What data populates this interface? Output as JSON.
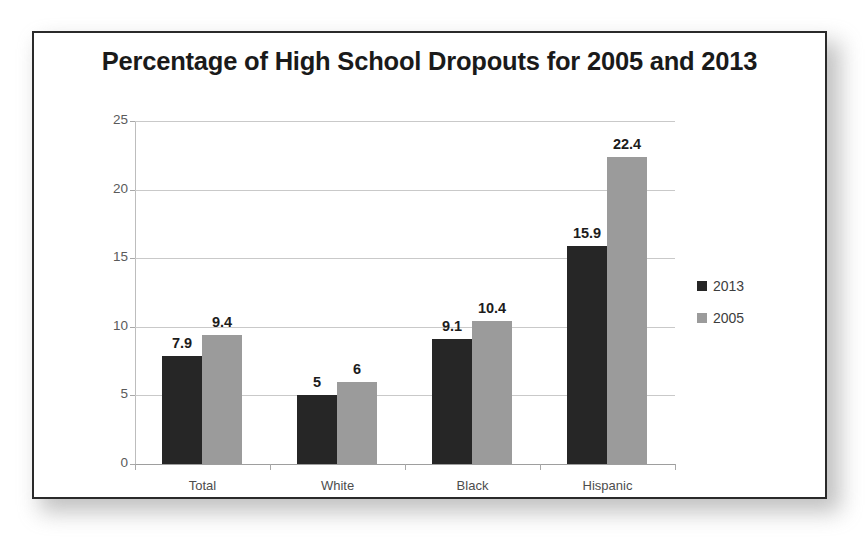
{
  "figure": {
    "title": "Percentage of High School Dropouts for 2005 and 2013",
    "frame_color": "#2a2a2a",
    "background": "#ffffff"
  },
  "chart_data": {
    "type": "bar",
    "title": "Percentage of High School Dropouts for 2005 and 2013",
    "xlabel": "",
    "ylabel": "",
    "ylim": [
      0,
      25
    ],
    "yticks": [
      0,
      5,
      10,
      15,
      20,
      25
    ],
    "ytick_labels": [
      "0",
      "5",
      "10",
      "15",
      "20",
      "25"
    ],
    "grid": true,
    "legend_position": "right",
    "categories": [
      "Total",
      "White",
      "Black",
      "Hispanic"
    ],
    "series": [
      {
        "name": "2013",
        "color": "#262626",
        "values": [
          7.9,
          5,
          9.1,
          15.9
        ],
        "labels": [
          "7.9",
          "5",
          "9.1",
          "15.9"
        ]
      },
      {
        "name": "2005",
        "color": "#9b9b9b",
        "values": [
          9.4,
          6,
          10.4,
          22.4
        ],
        "labels": [
          "9.4",
          "6",
          "10.4",
          "22.4"
        ]
      }
    ]
  },
  "legend": {
    "items": [
      {
        "label": "2013",
        "color": "#262626"
      },
      {
        "label": "2005",
        "color": "#9b9b9b"
      }
    ]
  },
  "colors": {
    "series_2013": "#262626",
    "series_2005": "#9b9b9b",
    "gridline": "#c9c9c9",
    "axis": "#9e9e9e",
    "tick_text": "#5a5a5a",
    "title_text": "#1a1a1a"
  }
}
